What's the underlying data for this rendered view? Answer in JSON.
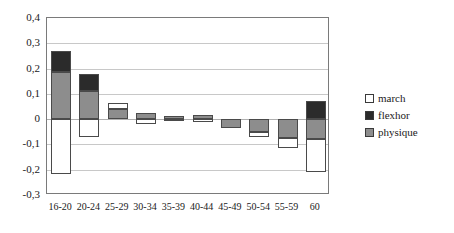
{
  "chart_data": {
    "type": "bar",
    "subtype": "stacked-bar-with-negative",
    "title": "",
    "subtitle": "",
    "xlabel": "",
    "ylabel": "",
    "categories": [
      "16-20",
      "20-24",
      "25-29",
      "30-34",
      "35-39",
      "40-44",
      "45-49",
      "50-54",
      "55-59",
      "60"
    ],
    "ylim": [
      -0.3,
      0.4
    ],
    "ytick_values": [
      0.4,
      0.3,
      0.2,
      0.1,
      0,
      -0.1,
      -0.2,
      -0.3
    ],
    "ytick_labels": [
      "0,4",
      "0,3",
      "0,2",
      "0,1",
      "0",
      "-0,1",
      "-0,2",
      "-0,3"
    ],
    "decimal_separator": ",",
    "grid": true,
    "grid_axis": "y",
    "legend_position": "right",
    "series": [
      {
        "name": "march",
        "color": "#ffffff",
        "values": [
          -0.215,
          -0.07,
          0.04,
          -0.018,
          -0.008,
          -0.012,
          -0.03,
          -0.06,
          -0.105,
          -0.21
        ]
      },
      {
        "name": "flexhor",
        "color": "#2b2b2b",
        "values": [
          0.085,
          0.07,
          0.0,
          0.0,
          0.0,
          0.0,
          0.0,
          0.0,
          0.0,
          0.07
        ]
      },
      {
        "name": "physique",
        "color": "#8d8d8d",
        "values": [
          0.185,
          0.11,
          0.025,
          0.02,
          0.008,
          0.015,
          -0.005,
          -0.012,
          -0.02,
          -0.08
        ]
      }
    ],
    "bars": [
      {
        "category": "16-20",
        "segments": [
          {
            "series": "flexhor",
            "from": 0.185,
            "to": 0.27
          },
          {
            "series": "physique",
            "from": 0.0,
            "to": 0.185
          },
          {
            "series": "march",
            "from": -0.215,
            "to": 0.0
          }
        ]
      },
      {
        "category": "20-24",
        "segments": [
          {
            "series": "flexhor",
            "from": 0.11,
            "to": 0.18
          },
          {
            "series": "physique",
            "from": 0.0,
            "to": 0.11
          },
          {
            "series": "march",
            "from": -0.07,
            "to": 0.0
          }
        ]
      },
      {
        "category": "25-29",
        "segments": [
          {
            "series": "march",
            "from": 0.04,
            "to": 0.065
          },
          {
            "series": "physique",
            "from": 0.0,
            "to": 0.04
          }
        ]
      },
      {
        "category": "30-34",
        "segments": [
          {
            "series": "physique",
            "from": 0.0,
            "to": 0.025
          },
          {
            "series": "march",
            "from": -0.018,
            "to": 0.0
          }
        ]
      },
      {
        "category": "35-39",
        "segments": [
          {
            "series": "physique",
            "from": 0.0,
            "to": 0.012
          },
          {
            "series": "march",
            "from": -0.008,
            "to": 0.0
          }
        ]
      },
      {
        "category": "40-44",
        "segments": [
          {
            "series": "physique",
            "from": 0.0,
            "to": 0.018
          },
          {
            "series": "march",
            "from": -0.012,
            "to": 0.0
          }
        ]
      },
      {
        "category": "45-49",
        "segments": [
          {
            "series": "physique",
            "from": -0.035,
            "to": 0.0
          }
        ]
      },
      {
        "category": "50-54",
        "segments": [
          {
            "series": "physique",
            "from": -0.05,
            "to": 0.0
          },
          {
            "series": "march",
            "from": -0.072,
            "to": -0.05
          }
        ]
      },
      {
        "category": "55-59",
        "segments": [
          {
            "series": "physique",
            "from": -0.075,
            "to": 0.0
          },
          {
            "series": "march",
            "from": -0.115,
            "to": -0.075
          }
        ]
      },
      {
        "category": "60",
        "segments": [
          {
            "series": "flexhor",
            "from": 0.0,
            "to": 0.07
          },
          {
            "series": "physique",
            "from": -0.08,
            "to": 0.0
          },
          {
            "series": "march",
            "from": -0.21,
            "to": -0.08
          }
        ]
      }
    ],
    "legend": [
      {
        "label": "march",
        "color": "#ffffff"
      },
      {
        "label": "flexhor",
        "color": "#2b2b2b"
      },
      {
        "label": "physique",
        "color": "#8d8d8d"
      }
    ]
  }
}
